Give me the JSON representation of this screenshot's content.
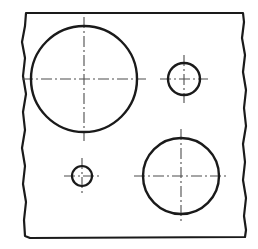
{
  "document": {
    "title": "Engineering Plate Drawing",
    "view_type": "orthographic-plan-view",
    "background_color": "#ffffff",
    "line_color": "#1a1a1a",
    "centerline_color": "#555555"
  },
  "canvas": {
    "width": 258,
    "height": 249
  },
  "part_outline": {
    "name": "plate-outline",
    "style": "freehand-break-line",
    "stroke_width": 2.2,
    "color": "#1a1a1a",
    "path": "M 26 13 L 243 13 L 244 22 L 242 38 L 245 55 L 243 72 L 246 90 L 244 108 L 246 126 L 243 144 L 245 162 L 243 180 L 246 198 L 244 216 L 246 230 L 245 237 L 30 238 L 25 236 L 24 220 L 26 202 L 23 184 L 25 166 L 22 148 L 25 130 L 23 112 L 26 94 L 23 76 L 25 58 L 22 42 L 25 26 Z"
  },
  "circles": [
    {
      "id": "hole-large-upper-left",
      "label": "Large Hole Upper Left",
      "cx": 84,
      "cy": 79,
      "r": 53,
      "stroke_width": 2.4,
      "centerline_overshoot": 9
    },
    {
      "id": "hole-small-upper-right",
      "label": "Small Hole Upper Right",
      "cx": 184,
      "cy": 79,
      "r": 16,
      "stroke_width": 2.4,
      "centerline_overshoot": 8
    },
    {
      "id": "hole-medium-lower-right",
      "label": "Medium Hole Lower Right",
      "cx": 181,
      "cy": 176,
      "r": 38,
      "stroke_width": 2.4,
      "centerline_overshoot": 9
    },
    {
      "id": "hole-tiny-lower-left",
      "label": "Tiny Hole Lower Left",
      "cx": 82,
      "cy": 176,
      "r": 10,
      "stroke_width": 2.2,
      "centerline_overshoot": 8
    }
  ],
  "centerline_style": {
    "dash_pattern": "11 3 2 3",
    "stroke_width": 1.1,
    "color": "#4d4d4d"
  }
}
